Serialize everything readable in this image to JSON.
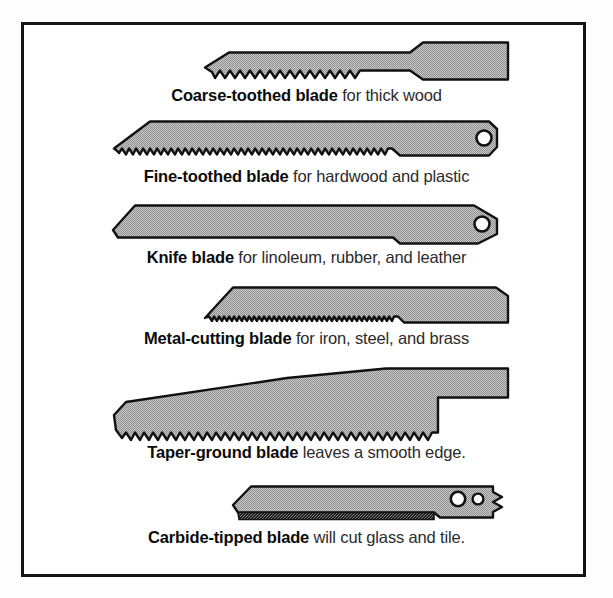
{
  "figure": {
    "frame": {
      "border_color": "#141414",
      "background_color": "#ffffff"
    },
    "blade_fill_color": "#b3b3b3",
    "blade_outline_color": "#111111"
  },
  "blades": [
    {
      "id": "coarse-toothed-blade",
      "name": "Coarse-toothed blade",
      "description": " for thick wood",
      "caption_full": "Coarse-toothed blade for thick wood",
      "teeth": "coarse",
      "holes": 0
    },
    {
      "id": "fine-toothed-blade",
      "name": "Fine-toothed blade",
      "description": " for hardwood and plastic",
      "caption_full": "Fine-toothed blade for hardwood and plastic",
      "teeth": "fine",
      "holes": 1
    },
    {
      "id": "knife-blade",
      "name": "Knife blade",
      "description": " for linoleum, rubber, and leather",
      "caption_full": "Knife blade for linoleum, rubber, and leather",
      "teeth": "none",
      "holes": 1
    },
    {
      "id": "metal-cutting-blade",
      "name": "Metal-cutting blade",
      "description": " for iron, steel, and brass",
      "caption_full": "Metal-cutting blade for iron, steel, and brass",
      "teeth": "very-fine",
      "holes": 0
    },
    {
      "id": "taper-ground-blade",
      "name": "Taper-ground blade",
      "description": " leaves a smooth edge.",
      "caption_full": "Taper-ground blade leaves a smooth edge.",
      "teeth": "coarse",
      "holes": 0
    },
    {
      "id": "carbide-tipped-blade",
      "name": "Carbide-tipped blade",
      "description": " will cut glass and tile.",
      "caption_full": "Carbide-tipped blade will cut glass and tile.",
      "teeth": "carbide-grit",
      "holes": 2
    }
  ]
}
